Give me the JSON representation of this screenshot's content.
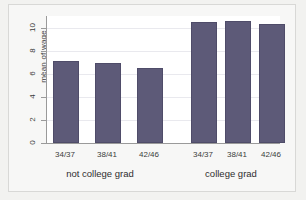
{
  "chart_data": {
    "type": "bar",
    "title": "",
    "subtitle": "",
    "xlabel": "",
    "ylabel": "mean of wage",
    "ylim": [
      0,
      11
    ],
    "yticks": [
      0,
      2,
      4,
      6,
      8,
      10
    ],
    "ytick_labels": [
      "0",
      "2",
      "4",
      "6",
      "8",
      "10"
    ],
    "grid": true,
    "legend": "none",
    "categories": [
      "34/37",
      "38/41",
      "42/46"
    ],
    "groups": [
      "not college grad",
      "college grad"
    ],
    "series": [
      {
        "name": "not college grad",
        "values": [
          7.1,
          6.9,
          6.5
        ]
      },
      {
        "name": "college grad",
        "values": [
          10.5,
          10.6,
          10.3
        ]
      }
    ],
    "bars": [
      {
        "group": "not college grad",
        "category": "34/37",
        "value": 7.1
      },
      {
        "group": "not college grad",
        "category": "38/41",
        "value": 6.9
      },
      {
        "group": "not college grad",
        "category": "42/46",
        "value": 6.5
      },
      {
        "group": "college grad",
        "category": "34/37",
        "value": 10.5
      },
      {
        "group": "college grad",
        "category": "38/41",
        "value": 10.6
      },
      {
        "group": "college grad",
        "category": "42/46",
        "value": 10.3
      }
    ],
    "colors": {
      "bar_fill": "#5d5a78",
      "bar_edge": "#4f4c69",
      "plot_background": "#ffffff",
      "figure_background": "#f7f7f6",
      "gridline": "#e9e9ee",
      "axis": "#9a9a9a",
      "text": "#3c3c3c"
    }
  }
}
